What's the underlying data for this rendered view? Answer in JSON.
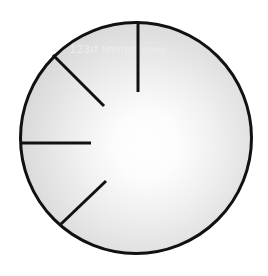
{
  "figure": {
    "background_color": "#ffffff",
    "watermark": {
      "text": "123rf limited  www",
      "x": 70,
      "y": 53,
      "color": "#ededed"
    }
  },
  "chart_data": {
    "type": "scatter",
    "xlabel": "",
    "ylabel": "",
    "xlim": [
      0,
      268
    ],
    "ylim": [
      0,
      276
    ],
    "grid": false,
    "legend": null,
    "circle": {
      "name": "outer-circle",
      "center_x": 136,
      "center_y": 138,
      "radius": 117,
      "stroke_color": "#111111",
      "stroke_width": 3,
      "fill_type": "radial-gradient",
      "fill_highlight_color": "#ffffff",
      "fill_edge_color": "#c7c7c7",
      "highlight_center_x": 147,
      "highlight_center_y": 146
    },
    "segments": [
      {
        "name": "segment-vertical-top",
        "x1": 138,
        "y1": 21,
        "x2": 138,
        "y2": 92,
        "angle_deg": 90,
        "stroke_color": "#111111",
        "stroke_width": 3
      },
      {
        "name": "segment-upper-left-diagonal",
        "x1": 53,
        "y1": 55,
        "x2": 104,
        "y2": 106,
        "angle_deg": 135,
        "stroke_color": "#111111",
        "stroke_width": 3
      },
      {
        "name": "segment-left-horizontal",
        "x1": 20,
        "y1": 143,
        "x2": 91,
        "y2": 143,
        "angle_deg": 180,
        "stroke_color": "#111111",
        "stroke_width": 3
      },
      {
        "name": "segment-lower-left-diagonal",
        "x1": 61,
        "y1": 224,
        "x2": 106,
        "y2": 181,
        "angle_deg": 225,
        "stroke_color": "#111111",
        "stroke_width": 3
      }
    ]
  }
}
